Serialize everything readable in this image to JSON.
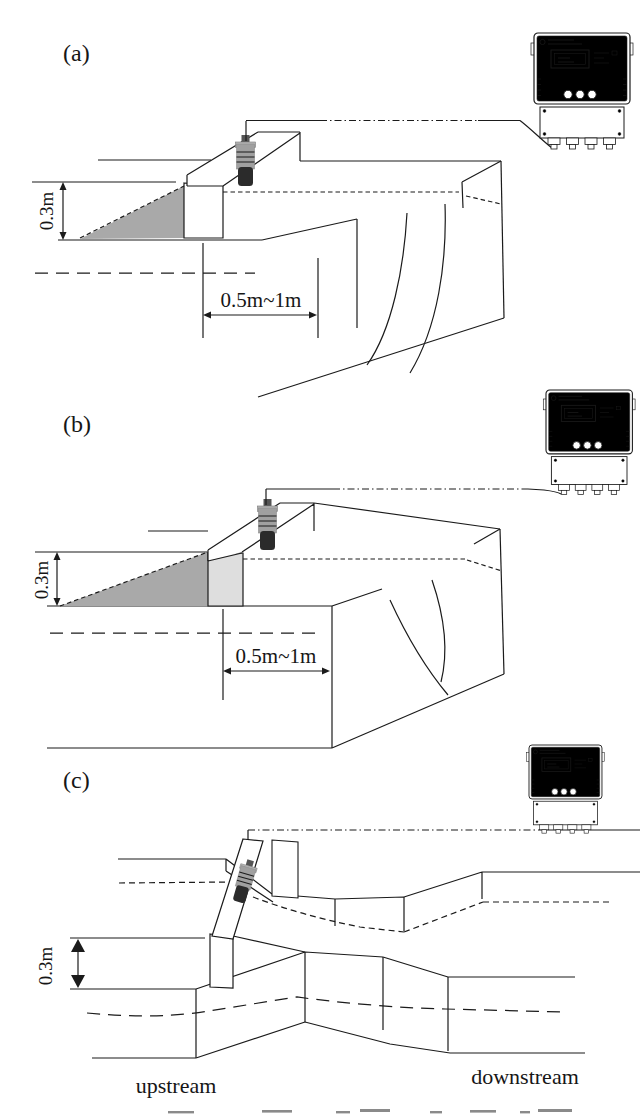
{
  "figure": {
    "panels": {
      "a": {
        "label": "(a)",
        "height_label": "0.3m",
        "distance_label": "0.5m~1m"
      },
      "b": {
        "label": "(b)",
        "height_label": "0.3m",
        "distance_label": "0.5m~1m"
      },
      "c": {
        "label": "(c)",
        "height_label": "0.3m",
        "upstream_label": "upstream",
        "downstream_label": "downstream"
      }
    },
    "icons": {
      "controller": "ultrasonic-flow-meter-controller-icon",
      "sensor": "ultrasonic-level-sensor-icon"
    },
    "colors": {
      "water_gray": "#a9a9a9",
      "water_gray_flume": "#b5b5b5",
      "weir_plate_gray": "#dedede",
      "line_color": "#1b1b1b",
      "sensor_body_gray": "#a0a0a0",
      "sensor_tip_dark": "#2b2b2b"
    }
  }
}
